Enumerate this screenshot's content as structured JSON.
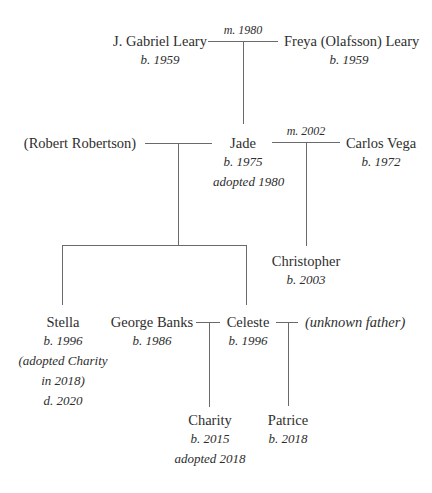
{
  "diagram": {
    "type": "family-tree",
    "people": [
      {
        "id": "gabriel",
        "name": "J. Gabriel Leary",
        "lines": [
          "b. 1959"
        ]
      },
      {
        "id": "freya",
        "name": "Freya (Olafsson) Leary",
        "lines": [
          "b. 1959"
        ]
      },
      {
        "id": "robert",
        "name": "(Robert Robertson)",
        "lines": []
      },
      {
        "id": "jade",
        "name": "Jade",
        "lines": [
          "b. 1975",
          "adopted 1980"
        ]
      },
      {
        "id": "carlos",
        "name": "Carlos Vega",
        "lines": [
          "b. 1972"
        ]
      },
      {
        "id": "christopher",
        "name": "Christopher",
        "lines": [
          "b. 2003"
        ]
      },
      {
        "id": "stella",
        "name": "Stella",
        "lines": [
          "b. 1996",
          "(adopted Charity",
          "in 2018)",
          "d. 2020"
        ]
      },
      {
        "id": "george",
        "name": "George Banks",
        "lines": [
          "b. 1986"
        ]
      },
      {
        "id": "celeste",
        "name": "Celeste",
        "lines": [
          "b. 1996"
        ]
      },
      {
        "id": "unknown",
        "name": "(unknown father)",
        "lines": []
      },
      {
        "id": "charity",
        "name": "Charity",
        "lines": [
          "b. 2015",
          "adopted 2018"
        ]
      },
      {
        "id": "patrice",
        "name": "Patrice",
        "lines": [
          "b. 2018"
        ]
      }
    ],
    "unions": [
      {
        "partners": [
          "gabriel",
          "freya"
        ],
        "label": "m. 1980",
        "children": [
          "jade"
        ]
      },
      {
        "partners": [
          "robert",
          "jade"
        ],
        "label": "",
        "children": [
          "stella",
          "celeste"
        ]
      },
      {
        "partners": [
          "jade",
          "carlos"
        ],
        "label": "m. 2002",
        "children": [
          "christopher"
        ]
      },
      {
        "partners": [
          "george",
          "celeste"
        ],
        "label": "",
        "children": [
          "charity"
        ]
      },
      {
        "partners": [
          "celeste",
          "unknown"
        ],
        "label": "",
        "children": [
          "patrice"
        ]
      }
    ]
  }
}
